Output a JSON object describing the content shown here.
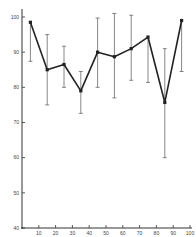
{
  "chart_data": {
    "type": "line",
    "title": "",
    "xlabel": "",
    "ylabel": "",
    "xlim": [
      0,
      100
    ],
    "ylim": [
      40,
      100
    ],
    "grid": false,
    "legend": null,
    "x_ticks": [
      10,
      20,
      30,
      40,
      50,
      60,
      70,
      80,
      90,
      100
    ],
    "y_ticks": [
      40,
      50,
      60,
      70,
      80,
      90,
      100
    ],
    "series": [
      {
        "name": "mean",
        "x": [
          5,
          15,
          25,
          35,
          45,
          55,
          65,
          75,
          85,
          95
        ],
        "y": [
          98.5,
          85,
          86.5,
          79,
          90,
          88.7,
          91,
          94.3,
          75.7,
          99
        ],
        "error_upper": [
          null,
          95,
          91.7,
          84.5,
          99.7,
          101,
          100.5,
          null,
          91,
          null
        ],
        "error_lower": [
          87.4,
          75,
          80,
          72.6,
          80,
          77,
          82,
          81.4,
          60,
          84.5
        ]
      }
    ],
    "style": {
      "line_color": "#222222",
      "error_bar_color": "#555555",
      "axis_color": "#333333"
    }
  }
}
